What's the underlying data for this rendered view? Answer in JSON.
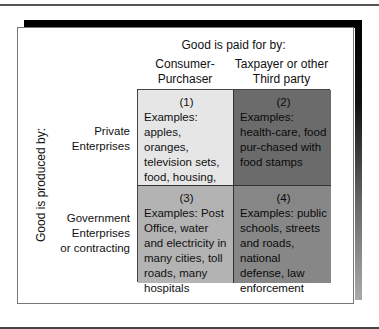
{
  "diagram": {
    "column_axis_title": "Good is paid for by:",
    "row_axis_title": "Good is produced by:",
    "columns": [
      {
        "line1": "Consumer-",
        "line2": "Purchaser"
      },
      {
        "line1": "Taxpayer or other",
        "line2": "Third party"
      }
    ],
    "rows": [
      {
        "line1": "Private",
        "line2": "Enterprises",
        "line3": ""
      },
      {
        "line1": "Government",
        "line2": "Enterprises",
        "line3": "or contracting"
      }
    ],
    "cells": [
      {
        "number": "(1)",
        "text": "Examples: apples, oranges, television sets, food, housing, most other goods",
        "fill": "#e6e6e6"
      },
      {
        "number": "(2)",
        "text": "Examples: health-care, food pur-chased with food stamps",
        "fill": "#6b6b6b"
      },
      {
        "number": "(3)",
        "text": "Examples: Post Office, water and electricity in many cities, toll roads, many hospitals",
        "fill": "#b3b3b3"
      },
      {
        "number": "(4)",
        "text": "Examples: public schools, streets and roads, national defense, law enforcement",
        "fill": "#878787"
      }
    ]
  }
}
